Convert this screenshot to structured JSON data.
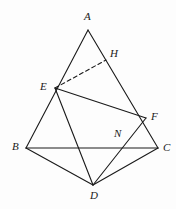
{
  "figure": {
    "background_color": "#fdfdfd",
    "stroke_color": "#1a1a1a",
    "stroke_width": 1.1,
    "width": 176,
    "height": 209
  },
  "points": {
    "A": {
      "name": "A",
      "x": 88,
      "y": 30,
      "label_x": 84,
      "label_y": 11
    },
    "B": {
      "name": "B",
      "x": 26,
      "y": 148,
      "label_x": 12,
      "label_y": 141
    },
    "C": {
      "name": "C",
      "x": 158,
      "y": 148,
      "label_x": 163,
      "label_y": 142
    },
    "D": {
      "name": "D",
      "x": 93,
      "y": 185,
      "label_x": 90,
      "label_y": 190
    },
    "E": {
      "name": "E",
      "x": 55,
      "y": 88,
      "label_x": 40,
      "label_y": 81
    },
    "F": {
      "name": "F",
      "x": 146,
      "y": 118,
      "label_x": 151,
      "label_y": 111
    },
    "H": {
      "name": "H",
      "x": 106,
      "y": 60,
      "label_x": 110,
      "label_y": 48
    },
    "N": {
      "name": "N",
      "x": 122,
      "y": 143,
      "label_x": 114,
      "label_y": 128
    }
  },
  "edges": [
    {
      "name": "edge-A-B",
      "from": "A",
      "to": "B",
      "style": "solid"
    },
    {
      "name": "edge-A-C",
      "from": "A",
      "to": "C",
      "style": "solid"
    },
    {
      "name": "edge-B-C",
      "from": "B",
      "to": "C",
      "style": "solid"
    },
    {
      "name": "edge-B-D",
      "from": "B",
      "to": "D",
      "style": "solid"
    },
    {
      "name": "edge-D-C",
      "from": "D",
      "to": "C",
      "style": "solid"
    },
    {
      "name": "edge-E-F",
      "from": "E",
      "to": "F",
      "style": "solid"
    },
    {
      "name": "edge-E-D",
      "from": "E",
      "to": "D",
      "style": "solid"
    },
    {
      "name": "edge-D-F",
      "from": "D",
      "to": "F",
      "style": "solid"
    },
    {
      "name": "edge-E-H",
      "from": "E",
      "to": "H",
      "style": "dashed"
    }
  ],
  "labels": {
    "A": "A",
    "B": "B",
    "C": "C",
    "D": "D",
    "E": "E",
    "F": "F",
    "H": "H",
    "N": "N"
  }
}
